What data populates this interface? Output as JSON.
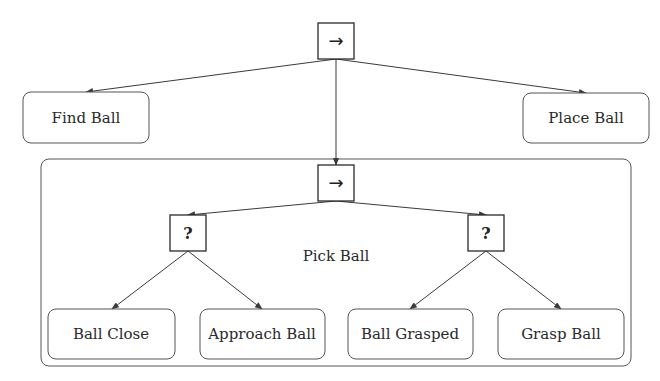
{
  "diagram": {
    "type": "behavior-tree",
    "root": {
      "kind": "sequence",
      "symbol": "→"
    },
    "top_children": {
      "find_ball": "Find Ball",
      "place_ball": "Place Ball"
    },
    "subtree": {
      "label": "Pick Ball",
      "sequence_symbol": "→",
      "fallback_left": {
        "symbol": "?"
      },
      "fallback_right": {
        "symbol": "?"
      },
      "leaves": {
        "ball_close": "Ball Close",
        "approach_ball": "Approach Ball",
        "ball_grasped": "Ball Grasped",
        "grasp_ball": "Grasp Ball"
      }
    }
  }
}
